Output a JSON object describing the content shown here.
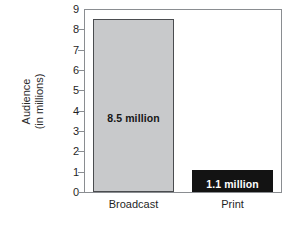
{
  "chart_data": {
    "type": "bar",
    "title": "",
    "xlabel": "",
    "ylabel": "Audience (in millions)",
    "ylabel_line1": "Audience",
    "ylabel_line2": "(in millions)",
    "categories": [
      "Broadcast",
      "Print"
    ],
    "values": [
      8.5,
      1.1
    ],
    "value_labels": [
      "8.5 million",
      "1.1 million"
    ],
    "ylim": [
      0,
      9
    ],
    "yticks": [
      0,
      1,
      2,
      3,
      4,
      5,
      6,
      7,
      8,
      9
    ],
    "ytick_labels": [
      "0",
      "1",
      "2",
      "3",
      "4",
      "5",
      "6",
      "7",
      "8",
      "9"
    ],
    "grid": false,
    "legend": false,
    "series": [
      {
        "name": "Audience",
        "values": [
          8.5,
          1.1
        ],
        "colors": [
          "#c8c9cb",
          "#131313"
        ]
      }
    ],
    "colors": {
      "bar_broadcast_fill": "#c8c9cb",
      "bar_broadcast_edge": "#4a4c4f",
      "bar_print_fill": "#131313",
      "axis": "#8a8d91",
      "text": "#1f1f1f",
      "label_on_dark": "#ffffff",
      "background": "#ffffff"
    }
  }
}
